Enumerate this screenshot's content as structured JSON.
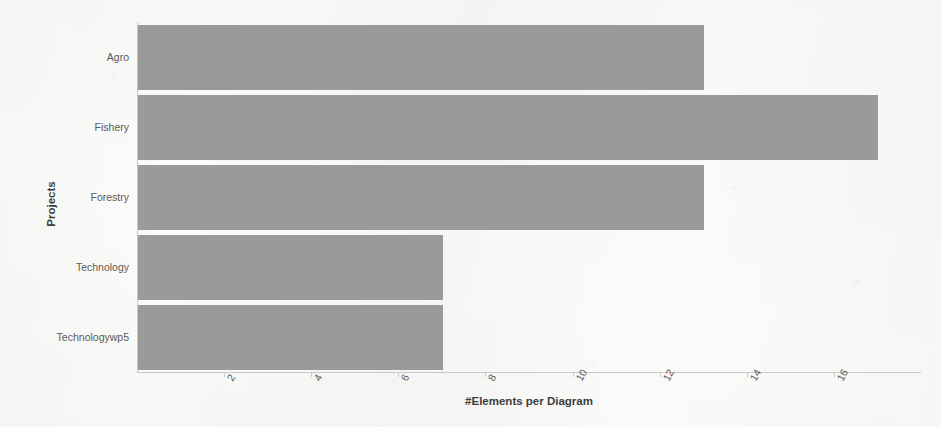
{
  "chart_data": {
    "type": "bar",
    "orientation": "horizontal",
    "title": "",
    "subtitle": "",
    "xlabel": "#Elements per Diagram",
    "ylabel": "Projects",
    "categories": [
      "Agro",
      "Fishery",
      "Forestry",
      "Technology",
      "Technologywp5"
    ],
    "values": [
      13,
      17,
      13,
      7,
      7
    ],
    "series": [
      {
        "name": "#Elements per Diagram",
        "values": [
          13,
          17,
          13,
          7,
          7
        ]
      }
    ],
    "xlim": [
      0,
      18
    ],
    "xticks": [
      2,
      4,
      6,
      8,
      10,
      12,
      14,
      16
    ],
    "xtick_labels": [
      "2",
      "4",
      "6",
      "8",
      "10",
      "12",
      "14",
      "16"
    ],
    "xtick_rotation": -60,
    "grid": false,
    "legend": false,
    "legend_position": "none",
    "bar_color": "#9a9a9a",
    "axis_color": "#c9c9c9",
    "background_color": "#fbfbfa",
    "text_color": "#5b5b5b",
    "title_color": "#3d3d3d"
  }
}
